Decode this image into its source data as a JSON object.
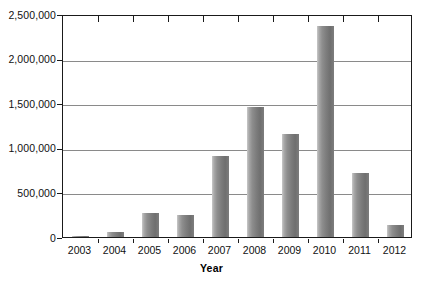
{
  "chart_data": {
    "type": "bar",
    "title": "",
    "subtitle": "",
    "xlabel": "Year",
    "ylabel": "",
    "categories": [
      "2003",
      "2004",
      "2005",
      "2006",
      "2007",
      "2008",
      "2009",
      "2010",
      "2011",
      "2012"
    ],
    "values": [
      3000,
      60000,
      270000,
      250000,
      910000,
      1455000,
      1150000,
      2370000,
      720000,
      135000
    ],
    "ylim": [
      0,
      2500000
    ],
    "ytick_values": [
      0,
      500000,
      1000000,
      1500000,
      2000000,
      2500000
    ],
    "ytick_labels": [
      "0",
      "500,000",
      "1,000,000",
      "1,500,000",
      "2,000,000",
      "2,500,000"
    ],
    "grid": true,
    "grid_axis": "y",
    "legend": false,
    "legend_position": "none",
    "bar_color": "#808080",
    "frame_color": "#1a1a1a",
    "gridline_color": "#8a8a8a",
    "background_color": "#ffffff"
  },
  "axes": {
    "x_title": "Year"
  }
}
